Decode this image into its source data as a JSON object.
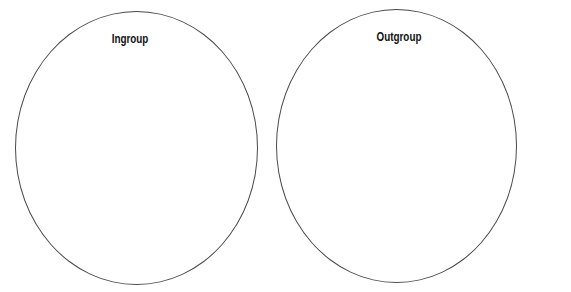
{
  "diagram": {
    "type": "two-circle comparison",
    "circles": [
      {
        "label": "Ingroup",
        "contents": ""
      },
      {
        "label": "Outgroup",
        "contents": ""
      }
    ],
    "colors": {
      "stroke": "#4a4a4a",
      "text": "#111111",
      "background": "#ffffff"
    }
  }
}
